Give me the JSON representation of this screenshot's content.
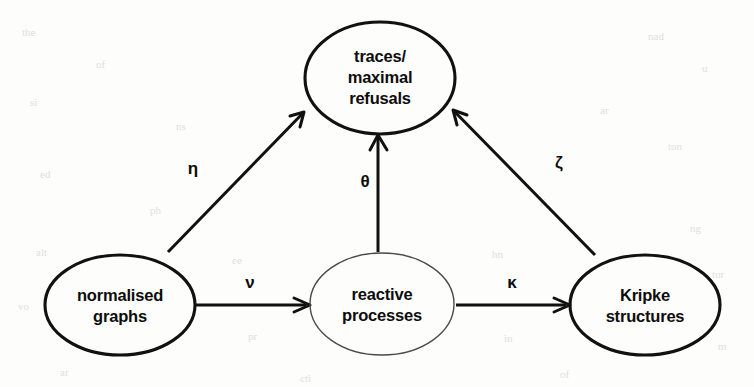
{
  "figure": {
    "type": "directed-graph",
    "background_color": "#fdfdfb",
    "stroke_color": "#111111",
    "nodes": [
      {
        "id": "traces",
        "lines": [
          "traces/",
          "maximal",
          "refusals"
        ],
        "cx": 380,
        "cy": 78,
        "rx": 75,
        "ry": 56,
        "stroke": "thick"
      },
      {
        "id": "normalised",
        "lines": [
          "normalised",
          "graphs"
        ],
        "cx": 120,
        "cy": 305,
        "rx": 75,
        "ry": 50,
        "stroke": "thick"
      },
      {
        "id": "reactive",
        "lines": [
          "reactive",
          "processes"
        ],
        "cx": 382,
        "cy": 304,
        "rx": 72,
        "ry": 51,
        "stroke": "thin"
      },
      {
        "id": "kripke",
        "lines": [
          "Kripke",
          "structures"
        ],
        "cx": 645,
        "cy": 305,
        "rx": 75,
        "ry": 50,
        "stroke": "thick"
      }
    ],
    "edges": [
      {
        "id": "eta",
        "label": "η",
        "from": "normalised",
        "to": "traces",
        "label_x": 193,
        "label_y": 174
      },
      {
        "id": "theta",
        "label": "θ",
        "from": "reactive",
        "to": "traces",
        "label_x": 365,
        "label_y": 187
      },
      {
        "id": "zeta",
        "label": "ζ",
        "from": "kripke",
        "to": "traces",
        "label_x": 559,
        "label_y": 168
      },
      {
        "id": "nu",
        "label": "ν",
        "from": "normalised",
        "to": "reactive",
        "label_x": 250,
        "label_y": 288
      },
      {
        "id": "kappa",
        "label": "κ",
        "from": "reactive",
        "to": "kripke",
        "label_x": 512,
        "label_y": 288
      }
    ],
    "scan_artifacts": [
      {
        "text": "the",
        "x": 22,
        "y": 26
      },
      {
        "text": "of",
        "x": 96,
        "y": 58
      },
      {
        "text": "nad",
        "x": 648,
        "y": 30
      },
      {
        "text": "u",
        "x": 702,
        "y": 62
      },
      {
        "text": "si",
        "x": 30,
        "y": 96
      },
      {
        "text": "ns",
        "x": 176,
        "y": 120
      },
      {
        "text": "ar",
        "x": 600,
        "y": 104
      },
      {
        "text": "ton",
        "x": 668,
        "y": 140
      },
      {
        "text": "ed",
        "x": 40,
        "y": 168
      },
      {
        "text": "ph",
        "x": 150,
        "y": 204
      },
      {
        "text": "li",
        "x": 540,
        "y": 196
      },
      {
        "text": "ng",
        "x": 690,
        "y": 222
      },
      {
        "text": "alt",
        "x": 36,
        "y": 246
      },
      {
        "text": "ee",
        "x": 232,
        "y": 254
      },
      {
        "text": "hn",
        "x": 492,
        "y": 248
      },
      {
        "text": "tur",
        "x": 712,
        "y": 268
      },
      {
        "text": "vo",
        "x": 18,
        "y": 300
      },
      {
        "text": "pr",
        "x": 248,
        "y": 330
      },
      {
        "text": "in",
        "x": 504,
        "y": 332
      },
      {
        "text": "m",
        "x": 718,
        "y": 340
      },
      {
        "text": "ar",
        "x": 60,
        "y": 366
      },
      {
        "text": "cti",
        "x": 300,
        "y": 372
      },
      {
        "text": "of",
        "x": 560,
        "y": 368
      }
    ]
  }
}
